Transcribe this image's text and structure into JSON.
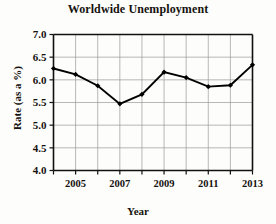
{
  "chart_data": {
    "type": "line",
    "title": "Worldwide Unemployment",
    "xlabel": "Year",
    "ylabel": "Rate (as a %)",
    "x": [
      2004,
      2005,
      2006,
      2007,
      2008,
      2009,
      2010,
      2011,
      2012,
      2013
    ],
    "values": [
      6.25,
      6.12,
      5.87,
      5.47,
      5.68,
      6.17,
      6.05,
      5.85,
      5.88,
      6.33
    ],
    "xlim": [
      2004,
      2013
    ],
    "ylim": [
      4.0,
      7.0
    ],
    "yticks": [
      "4.0",
      "4.5",
      "5.0",
      "5.5",
      "6.0",
      "6.5",
      "7.0"
    ],
    "ytick_values": [
      4.0,
      4.5,
      5.0,
      5.5,
      6.0,
      6.5,
      7.0
    ],
    "xticks": [
      2004,
      2005,
      2006,
      2007,
      2008,
      2009,
      2010,
      2011,
      2012,
      2013
    ],
    "xtick_labels": [
      "",
      "2005",
      "",
      "2007",
      "",
      "2009",
      "",
      "2011",
      "",
      "2013"
    ],
    "grid": true,
    "legend": "none",
    "marker": "diamond",
    "line_color": "#000000",
    "grid_color": "#9a9a9a",
    "axis_color": "#111111"
  }
}
